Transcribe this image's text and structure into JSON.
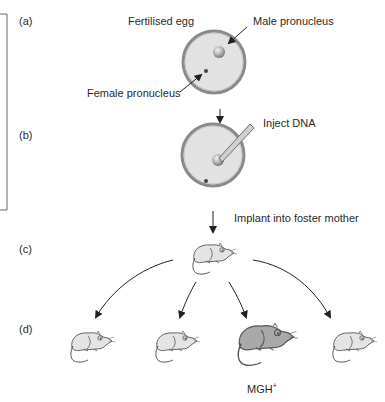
{
  "figure": {
    "steps": [
      {
        "id": "a",
        "label": "(a)"
      },
      {
        "id": "b",
        "label": "(b)"
      },
      {
        "id": "c",
        "label": "(c)"
      },
      {
        "id": "d",
        "label": "(d)"
      }
    ],
    "labels": {
      "fertilised_egg": "Fertilised egg",
      "male_pronucleus": "Male pronucleus",
      "female_pronucleus": "Female pronucleus",
      "inject_dna": "Inject DNA",
      "implant": "Implant into foster mother",
      "mgh": "MGH",
      "mgh_sup": "+"
    },
    "colors": {
      "egg_fill": "#e2e2e2",
      "egg_outline": "#8a8a8a",
      "mouse_fill": "#e4e4e4",
      "transgenic_mouse_fill": "#a9a9a9",
      "line": "#333333"
    },
    "offspring": [
      {
        "id": "pup-1",
        "transgenic": false
      },
      {
        "id": "pup-2",
        "transgenic": false
      },
      {
        "id": "pup-3",
        "transgenic": true
      },
      {
        "id": "pup-4",
        "transgenic": false
      }
    ]
  }
}
